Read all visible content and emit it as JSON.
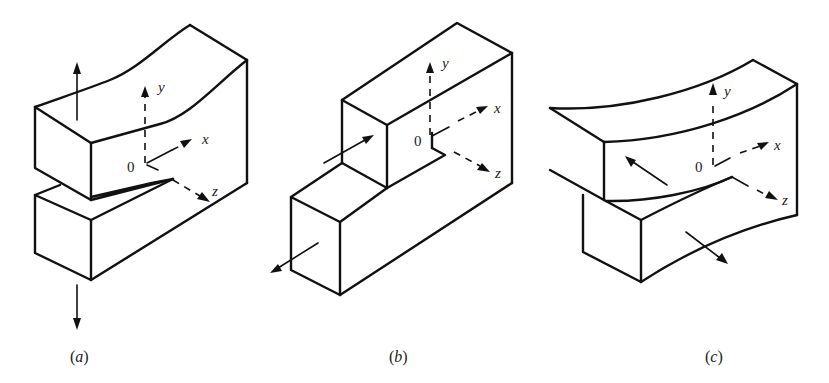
{
  "figure": {
    "panels": [
      {
        "id": "a",
        "caption_letter": "a",
        "caption": "(a)",
        "mode": "opening",
        "axes": {
          "origin": "0",
          "x": "x",
          "y": "y",
          "z": "z"
        },
        "load_arrows": [
          "up (top block)",
          "down (bottom block)"
        ]
      },
      {
        "id": "b",
        "caption_letter": "b",
        "caption": "(b)",
        "mode": "sliding",
        "axes": {
          "origin": "0",
          "x": "x",
          "y": "y",
          "z": "z"
        },
        "load_arrows": [
          "into +x (upper block)",
          "toward -x (lower block)"
        ]
      },
      {
        "id": "c",
        "caption_letter": "c",
        "caption": "(c)",
        "mode": "tearing",
        "axes": {
          "origin": "0",
          "x": "x",
          "y": "y",
          "z": "z"
        },
        "load_arrows": [
          "toward -z (upper block)",
          "toward +z (lower block)"
        ]
      }
    ]
  },
  "colors": {
    "line": "#111111",
    "text": "#222222",
    "background": "#ffffff"
  }
}
